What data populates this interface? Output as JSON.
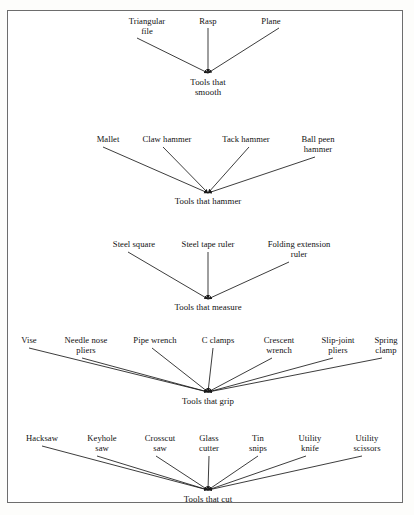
{
  "document": {
    "type": "concept-map",
    "title": "Tool classification concept map",
    "border_color": "#6d6d6d",
    "background_color": "#ffffff",
    "text_color": "#111111",
    "line_color": "#1a1a1a"
  },
  "chart_data": {
    "type": "diagram",
    "subtype": "converging-arrow concept map",
    "title": "",
    "groups": [
      {
        "id": "smooth",
        "root": "Tools that\nsmooth",
        "root_x": 208,
        "root_y": 78,
        "apex_x": 208,
        "apex_y": 73,
        "leaves": [
          {
            "label": "Triangular\nfile",
            "x": 147,
            "y": 17,
            "tail_x": 137,
            "tail_y": 38
          },
          {
            "label": "Rasp",
            "x": 208,
            "y": 17,
            "tail_x": 208,
            "tail_y": 28
          },
          {
            "label": "Plane",
            "x": 271,
            "y": 17,
            "tail_x": 279,
            "tail_y": 28
          }
        ]
      },
      {
        "id": "hammer",
        "root": "Tools that hammer",
        "root_x": 208,
        "root_y": 197,
        "apex_x": 208,
        "apex_y": 193,
        "leaves": [
          {
            "label": "Mallet",
            "x": 108,
            "y": 135,
            "tail_x": 103,
            "tail_y": 147
          },
          {
            "label": "Claw hammer",
            "x": 167,
            "y": 135,
            "tail_x": 163,
            "tail_y": 147
          },
          {
            "label": "Tack hammer",
            "x": 246,
            "y": 135,
            "tail_x": 249,
            "tail_y": 147
          },
          {
            "label": "Ball peen\nhammer",
            "x": 318,
            "y": 135,
            "tail_x": 315,
            "tail_y": 157
          }
        ]
      },
      {
        "id": "measure",
        "root": "Tools that measure",
        "root_x": 208,
        "root_y": 303,
        "apex_x": 208,
        "apex_y": 299,
        "leaves": [
          {
            "label": "Steel square",
            "x": 134,
            "y": 240,
            "tail_x": 128,
            "tail_y": 252
          },
          {
            "label": "Steel tape ruler",
            "x": 208,
            "y": 240,
            "tail_x": 208,
            "tail_y": 252
          },
          {
            "label": "Folding extension\nruler",
            "x": 299,
            "y": 240,
            "tail_x": 289,
            "tail_y": 262
          }
        ]
      },
      {
        "id": "grip",
        "root": "Tools that grip",
        "root_x": 208,
        "root_y": 397,
        "apex_x": 208,
        "apex_y": 392,
        "leaves": [
          {
            "label": "Vise",
            "x": 29,
            "y": 336,
            "tail_x": 29,
            "tail_y": 348
          },
          {
            "label": "Needle nose\npliers",
            "x": 86,
            "y": 336,
            "tail_x": 82,
            "tail_y": 358
          },
          {
            "label": "Pipe wrench",
            "x": 155,
            "y": 336,
            "tail_x": 152,
            "tail_y": 348
          },
          {
            "label": "C clamps",
            "x": 218,
            "y": 336,
            "tail_x": 213,
            "tail_y": 348
          },
          {
            "label": "Crescent\nwrench",
            "x": 279,
            "y": 336,
            "tail_x": 272,
            "tail_y": 358
          },
          {
            "label": "Slip-joint\npliers",
            "x": 338,
            "y": 336,
            "tail_x": 333,
            "tail_y": 358
          },
          {
            "label": "Spring\nclamp",
            "x": 386,
            "y": 336,
            "tail_x": 382,
            "tail_y": 358
          }
        ]
      },
      {
        "id": "cut",
        "root": "Tools that cut",
        "root_x": 208,
        "root_y": 495,
        "apex_x": 208,
        "apex_y": 490,
        "leaves": [
          {
            "label": "Hacksaw",
            "x": 42,
            "y": 434,
            "tail_x": 42,
            "tail_y": 446
          },
          {
            "label": "Keyhole\nsaw",
            "x": 102,
            "y": 434,
            "tail_x": 97,
            "tail_y": 456
          },
          {
            "label": "Crosscut\nsaw",
            "x": 160,
            "y": 434,
            "tail_x": 156,
            "tail_y": 456
          },
          {
            "label": "Glass\ncutter",
            "x": 209,
            "y": 434,
            "tail_x": 209,
            "tail_y": 456
          },
          {
            "label": "Tin\nsnips",
            "x": 258,
            "y": 434,
            "tail_x": 258,
            "tail_y": 456
          },
          {
            "label": "Utility\nknife",
            "x": 310,
            "y": 434,
            "tail_x": 306,
            "tail_y": 456
          },
          {
            "label": "Utility\nscissors",
            "x": 367,
            "y": 434,
            "tail_x": 362,
            "tail_y": 456
          }
        ]
      }
    ]
  }
}
